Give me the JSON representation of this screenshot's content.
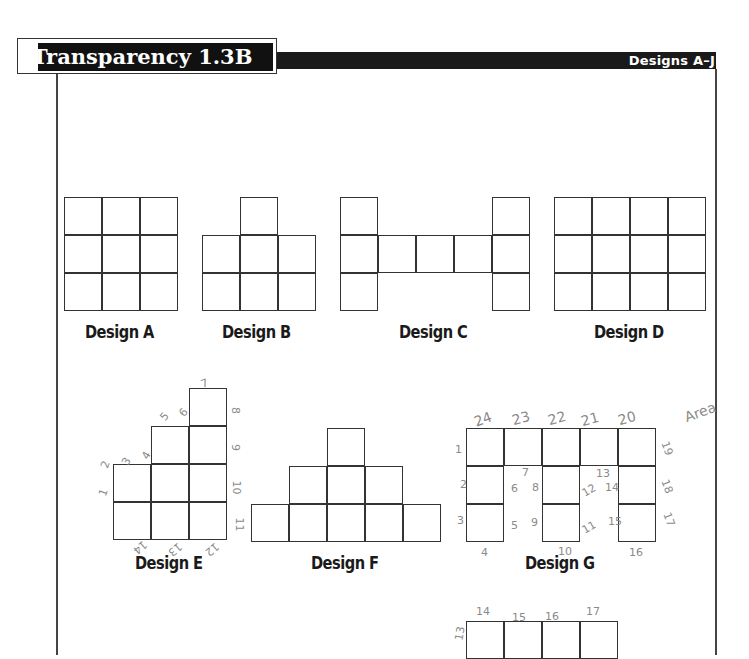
{
  "header": {
    "title": "Transparency 1.3B",
    "subtitle": "Designs A–J"
  },
  "designs": [
    {
      "id": "A",
      "label": "Design A",
      "cells": [
        [
          0,
          0
        ],
        [
          1,
          0
        ],
        [
          2,
          0
        ],
        [
          0,
          1
        ],
        [
          1,
          1
        ],
        [
          2,
          1
        ],
        [
          0,
          2
        ],
        [
          1,
          2
        ],
        [
          2,
          2
        ]
      ]
    },
    {
      "id": "B",
      "label": "Design B",
      "cells": [
        [
          1,
          0
        ],
        [
          0,
          1
        ],
        [
          1,
          1
        ],
        [
          2,
          1
        ],
        [
          0,
          2
        ],
        [
          1,
          2
        ],
        [
          2,
          2
        ]
      ]
    },
    {
      "id": "C",
      "label": "Design C",
      "cells": [
        [
          0,
          0
        ],
        [
          4,
          0
        ],
        [
          0,
          1
        ],
        [
          1,
          1
        ],
        [
          2,
          1
        ],
        [
          3,
          1
        ],
        [
          4,
          1
        ],
        [
          0,
          2
        ],
        [
          4,
          2
        ]
      ]
    },
    {
      "id": "D",
      "label": "Design D",
      "cells": [
        [
          0,
          0
        ],
        [
          1,
          0
        ],
        [
          2,
          0
        ],
        [
          3,
          0
        ],
        [
          0,
          1
        ],
        [
          1,
          1
        ],
        [
          2,
          1
        ],
        [
          3,
          1
        ],
        [
          0,
          2
        ],
        [
          1,
          2
        ],
        [
          2,
          2
        ],
        [
          3,
          2
        ]
      ]
    },
    {
      "id": "E",
      "label": "Design E",
      "cells": [
        [
          2,
          0
        ],
        [
          1,
          1
        ],
        [
          2,
          1
        ],
        [
          0,
          2
        ],
        [
          1,
          2
        ],
        [
          2,
          2
        ],
        [
          0,
          3
        ],
        [
          1,
          3
        ],
        [
          2,
          3
        ]
      ]
    },
    {
      "id": "F",
      "label": "Design F",
      "cells": [
        [
          2,
          0
        ],
        [
          1,
          1
        ],
        [
          2,
          1
        ],
        [
          3,
          1
        ],
        [
          0,
          2
        ],
        [
          1,
          2
        ],
        [
          2,
          2
        ],
        [
          3,
          2
        ],
        [
          4,
          2
        ]
      ]
    },
    {
      "id": "G",
      "label": "Design G",
      "cells": [
        [
          0,
          0
        ],
        [
          1,
          0
        ],
        [
          2,
          0
        ],
        [
          3,
          0
        ],
        [
          4,
          0
        ],
        [
          0,
          1
        ],
        [
          2,
          1
        ],
        [
          4,
          1
        ],
        [
          0,
          2
        ],
        [
          2,
          2
        ],
        [
          4,
          2
        ]
      ]
    },
    {
      "id": "H",
      "label": "",
      "cells": [
        [
          0,
          0
        ],
        [
          1,
          0
        ],
        [
          2,
          0
        ],
        [
          3,
          0
        ]
      ]
    }
  ],
  "annotations": {
    "design_e": [
      "1",
      "2",
      "3",
      "4",
      "5",
      "6",
      "7",
      "8",
      "9",
      "10",
      "11",
      "12",
      "13",
      "14"
    ],
    "design_g": [
      "1",
      "2",
      "3",
      "4",
      "5",
      "6",
      "7",
      "8",
      "9",
      "10",
      "11",
      "12",
      "13",
      "14",
      "15",
      "16",
      "17",
      "18",
      "19",
      "20",
      "21",
      "22",
      "23",
      "24"
    ],
    "design_h": [
      "13",
      "14",
      "15",
      "16",
      "17"
    ],
    "margin_note": "Area"
  }
}
